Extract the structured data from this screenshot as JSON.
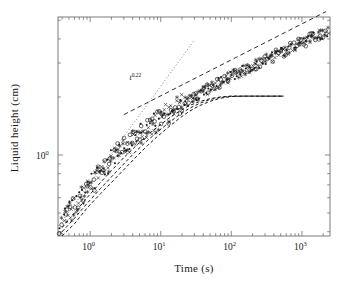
{
  "chart_data": {
    "type": "scatter",
    "title": "",
    "xlabel": "Time (s)",
    "ylabel": "Liquid height (cm)",
    "xscale": "log",
    "yscale": "log",
    "xlim": [
      0.35,
      2500
    ],
    "ylim": [
      0.38,
      5.2
    ],
    "xticks": [
      1,
      10,
      100,
      1000
    ],
    "xtick_labels": [
      "10",
      "10",
      "10",
      "10"
    ],
    "xtick_exponents": [
      "0",
      "1",
      "2",
      "3"
    ],
    "yticks": [
      1
    ],
    "ytick_labels": [
      "10"
    ],
    "ytick_exponents": [
      "0"
    ],
    "grid": false,
    "legend": false,
    "annotations": [
      {
        "name": "power-law-label",
        "text": "t",
        "exponent": "0.22",
        "x": 3.6,
        "y": 2.45
      }
    ],
    "series": [
      {
        "name": "experimental data band",
        "kind": "scatter",
        "markers": [
          "open-circle",
          "filled-dot",
          "cross",
          "star"
        ],
        "color": "#1a1a1a",
        "x": [
          0.38,
          0.4,
          0.42,
          0.45,
          0.48,
          0.5,
          0.52,
          0.55,
          0.6,
          0.65,
          0.7,
          0.75,
          0.8,
          0.9,
          1.0,
          1.1,
          1.2,
          1.4,
          1.6,
          1.8,
          2.0,
          2.3,
          2.6,
          3.0,
          3.4,
          3.8,
          4.3,
          4.8,
          5.4,
          6.0,
          6.8,
          7.6,
          8.5,
          9.5,
          11,
          12,
          14,
          16,
          18,
          20,
          23,
          26,
          30,
          34,
          38,
          43,
          48,
          54,
          60,
          68,
          76,
          85,
          95,
          110,
          120,
          140,
          160,
          180,
          200,
          230,
          260,
          300,
          340,
          380,
          430,
          480,
          540,
          600,
          680,
          760,
          850,
          950,
          1100,
          1200,
          1400,
          1600,
          1800,
          2000,
          2200
        ],
        "y": [
          0.44,
          0.45,
          0.46,
          0.47,
          0.49,
          0.5,
          0.51,
          0.52,
          0.55,
          0.57,
          0.59,
          0.61,
          0.63,
          0.66,
          0.7,
          0.73,
          0.76,
          0.81,
          0.86,
          0.9,
          0.94,
          0.99,
          1.04,
          1.09,
          1.14,
          1.18,
          1.23,
          1.27,
          1.31,
          1.35,
          1.4,
          1.44,
          1.48,
          1.53,
          1.58,
          1.62,
          1.68,
          1.74,
          1.79,
          1.83,
          1.89,
          1.94,
          2.0,
          2.06,
          2.11,
          2.16,
          2.21,
          2.27,
          2.32,
          2.38,
          2.43,
          2.49,
          2.54,
          2.61,
          2.65,
          2.73,
          2.79,
          2.85,
          2.9,
          2.97,
          3.03,
          3.11,
          3.17,
          3.23,
          3.31,
          3.37,
          3.44,
          3.51,
          3.59,
          3.66,
          3.73,
          3.8,
          3.89,
          3.95,
          4.05,
          4.14,
          4.22,
          4.29,
          4.36
        ],
        "scatter_spread": 0.09,
        "point_count": 420
      },
      {
        "name": "power-law guide line",
        "kind": "line",
        "style": "dashed",
        "color": "#1a1a1a",
        "exponent": 0.22,
        "x": [
          3.0,
          2200
        ],
        "y": [
          1.62,
          5.55
        ]
      },
      {
        "name": "steep reference line",
        "kind": "line",
        "style": "dotted",
        "color": "#555555",
        "exponent": 0.5,
        "x": [
          0.36,
          30
        ],
        "y": [
          0.43,
          3.95
        ]
      },
      {
        "name": "model curve 1",
        "kind": "line",
        "style": "dashed",
        "color": "#1a1a1a",
        "plateau": 2.02,
        "x": [
          0.4,
          0.6,
          0.9,
          1.4,
          2.0,
          3.0,
          4.5,
          6.5,
          9,
          13,
          18,
          25,
          35,
          50,
          70,
          100,
          150,
          220,
          320,
          450,
          550
        ],
        "y": [
          0.42,
          0.5,
          0.6,
          0.72,
          0.83,
          0.97,
          1.12,
          1.27,
          1.4,
          1.55,
          1.68,
          1.8,
          1.89,
          1.96,
          2.0,
          2.02,
          2.02,
          2.02,
          2.02,
          2.02,
          2.02
        ]
      },
      {
        "name": "model curve 2",
        "kind": "line",
        "style": "dashed",
        "color": "#1a1a1a",
        "plateau": 2.02,
        "x": [
          0.4,
          0.6,
          0.9,
          1.4,
          2.0,
          3.0,
          4.5,
          6.5,
          9,
          13,
          18,
          25,
          35,
          50,
          70,
          100,
          150,
          220,
          320,
          450,
          550
        ],
        "y": [
          0.4,
          0.47,
          0.56,
          0.67,
          0.77,
          0.9,
          1.05,
          1.19,
          1.32,
          1.47,
          1.61,
          1.74,
          1.85,
          1.94,
          1.99,
          2.02,
          2.02,
          2.02,
          2.02,
          2.02,
          2.02
        ]
      },
      {
        "name": "model curve 3",
        "kind": "line",
        "style": "dashed",
        "color": "#1a1a1a",
        "plateau": 2.02,
        "x": [
          0.4,
          0.6,
          0.9,
          1.4,
          2.0,
          3.0,
          4.5,
          6.5,
          9,
          13,
          18,
          25,
          35,
          50,
          70,
          100,
          150,
          220,
          320,
          450,
          550
        ],
        "y": [
          0.38,
          0.44,
          0.53,
          0.63,
          0.72,
          0.84,
          0.98,
          1.12,
          1.25,
          1.4,
          1.54,
          1.68,
          1.8,
          1.9,
          1.97,
          2.01,
          2.02,
          2.02,
          2.02,
          2.02,
          2.02
        ]
      }
    ]
  }
}
